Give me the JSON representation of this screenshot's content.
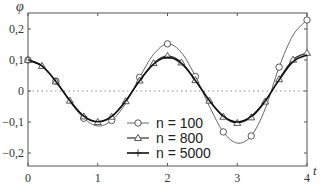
{
  "chart_data": {
    "type": "line",
    "title": "",
    "xlabel": "t",
    "ylabel": "φ",
    "xlim": [
      0,
      4
    ],
    "ylim": [
      -0.245,
      0.25
    ],
    "grid": false,
    "zero_line": "dotted",
    "x_ticks": [
      "0",
      "1",
      "2",
      "3",
      "4"
    ],
    "y_ticks": [
      "0,2",
      "0,1",
      "0",
      "-0,1",
      "-0,2"
    ],
    "legend_position": "lower center",
    "x": [
      0,
      0.2,
      0.4,
      0.6,
      0.8,
      1.0,
      1.2,
      1.4,
      1.6,
      1.8,
      2.0,
      2.2,
      2.4,
      2.6,
      2.8,
      3.0,
      3.2,
      3.4,
      3.6,
      3.8,
      4.0
    ],
    "series": [
      {
        "name": "n = 100",
        "marker": "circle",
        "marker_every": 0.4,
        "values": [
          0.1,
          0.082,
          0.032,
          -0.034,
          -0.088,
          -0.113,
          -0.095,
          -0.04,
          0.044,
          0.118,
          0.152,
          0.124,
          0.047,
          -0.049,
          -0.132,
          -0.168,
          -0.145,
          -0.058,
          0.077,
          0.18,
          0.229
        ]
      },
      {
        "name": "n = 800",
        "marker": "triangle",
        "marker_every": 0.2,
        "values": [
          0.1,
          0.081,
          0.031,
          -0.031,
          -0.082,
          -0.1,
          -0.083,
          -0.033,
          0.034,
          0.09,
          0.113,
          0.092,
          0.035,
          -0.031,
          -0.083,
          -0.103,
          -0.085,
          -0.034,
          0.038,
          0.101,
          0.123
        ]
      },
      {
        "name": "n = 5000",
        "marker": "plus",
        "marker_every": 0.4,
        "values": [
          0.1,
          0.081,
          0.031,
          -0.031,
          -0.081,
          -0.099,
          -0.082,
          -0.032,
          0.033,
          0.087,
          0.109,
          0.089,
          0.034,
          -0.031,
          -0.081,
          -0.1,
          -0.082,
          -0.032,
          0.036,
          0.095,
          0.116
        ]
      }
    ]
  }
}
